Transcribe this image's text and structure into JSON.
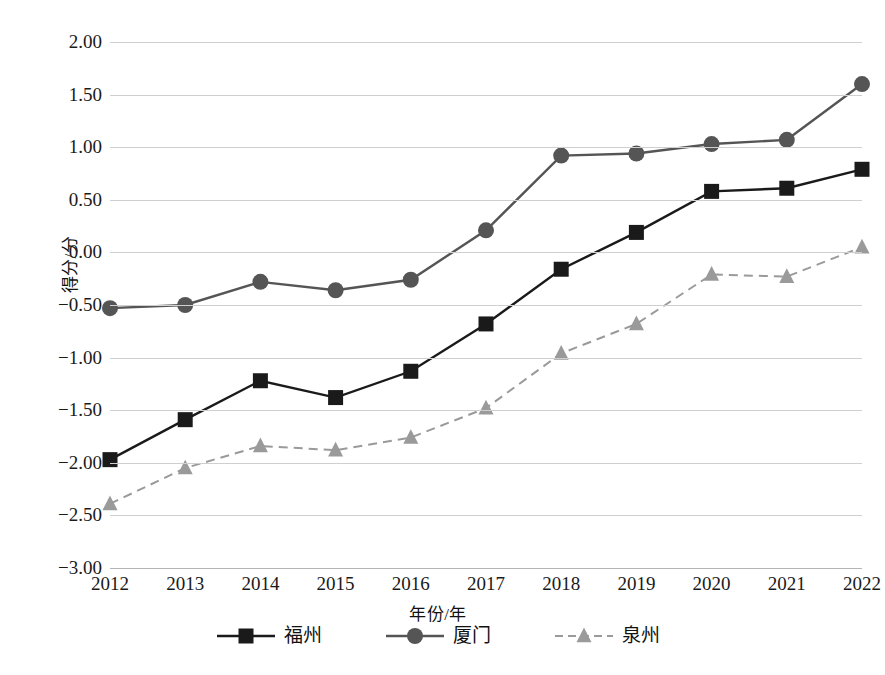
{
  "chart_data": {
    "type": "line",
    "title": "",
    "subtitle": "",
    "xlabel": "年份/年",
    "ylabel": "得分/分",
    "x": [
      2012,
      2013,
      2014,
      2015,
      2016,
      2017,
      2018,
      2019,
      2020,
      2021,
      2022
    ],
    "categories": [
      "2012",
      "2013",
      "2014",
      "2015",
      "2016",
      "2017",
      "2018",
      "2019",
      "2020",
      "2021",
      "2022"
    ],
    "xlim": [
      2012,
      2022
    ],
    "ylim": [
      -3.0,
      2.0
    ],
    "ytick_labels": [
      "2.00",
      "1.50",
      "1.00",
      "0.50",
      "0.00",
      "−0.50",
      "−1.00",
      "−1.50",
      "−2.00",
      "−2.50",
      "−3.00"
    ],
    "ytick_values": [
      2.0,
      1.5,
      1.0,
      0.5,
      0.0,
      -0.5,
      -1.0,
      -1.5,
      -2.0,
      -2.5,
      -3.0
    ],
    "grid": "horizontal",
    "legend_position": "bottom",
    "series": [
      {
        "name": "福州",
        "color": "#1a1a1a",
        "marker": "square",
        "line_style": "solid",
        "values": [
          -1.97,
          -1.59,
          -1.22,
          -1.38,
          -1.13,
          -0.68,
          -0.16,
          0.19,
          0.58,
          0.61,
          0.79
        ]
      },
      {
        "name": "厦门",
        "color": "#555555",
        "marker": "circle",
        "line_style": "solid",
        "values": [
          -0.53,
          -0.5,
          -0.28,
          -0.36,
          -0.26,
          0.21,
          0.92,
          0.94,
          1.03,
          1.07,
          1.6
        ]
      },
      {
        "name": "泉州",
        "color": "#9a9a9a",
        "marker": "triangle",
        "line_style": "dashed",
        "values": [
          -2.39,
          -2.05,
          -1.84,
          -1.88,
          -1.76,
          -1.48,
          -0.96,
          -0.68,
          -0.21,
          -0.23,
          0.05
        ]
      }
    ]
  },
  "legend": {
    "items": [
      {
        "label": "福州"
      },
      {
        "label": "厦门"
      },
      {
        "label": "泉州"
      }
    ]
  },
  "colors": {
    "fuzhou": "#1a1a1a",
    "xiamen": "#555555",
    "quanzhou": "#9a9a9a",
    "gridline": "#cfcfcf",
    "background": "#ffffff"
  }
}
